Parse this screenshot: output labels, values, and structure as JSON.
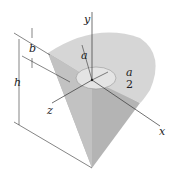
{
  "figure": {
    "labels": {
      "y": "y",
      "x": "x",
      "z": "z",
      "a": "a",
      "a_num": "a",
      "a_den": "2",
      "b": "b",
      "h": "h"
    },
    "colors": {
      "top_face": "#d4d4d4",
      "cone_side": "#b8b8b8",
      "cut_face": "#c6c6c6",
      "line": "#333333"
    }
  }
}
